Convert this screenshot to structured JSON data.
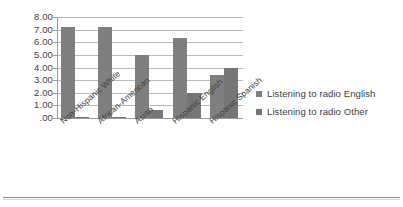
{
  "chart_data": {
    "type": "bar",
    "title": "",
    "subtitle": "",
    "xlabel": "",
    "ylabel": "",
    "categories": [
      "Non-Hispanic White",
      "African-American",
      "Asian",
      "Hispanic English",
      "Hispanic Spanish"
    ],
    "series": [
      {
        "name": "Listening to radio English",
        "color": "#7f7f7f",
        "values": [
          7.2,
          7.2,
          5.0,
          6.3,
          3.4
        ]
      },
      {
        "name": "Listening to radio Other",
        "color": "#767676",
        "values": [
          0.05,
          0.1,
          0.6,
          1.95,
          3.95
        ]
      }
    ],
    "ylim": [
      0,
      8
    ],
    "ytick_values": [
      0,
      1,
      2,
      3,
      4,
      5,
      6,
      7,
      8
    ],
    "ytick_labels": [
      ".00",
      "1.00",
      "2.00",
      "3.00",
      "4.00",
      "5.00",
      "6.00",
      "7.00",
      "8.00"
    ],
    "grid": true,
    "grid_axis": "y",
    "legend_position": "right",
    "xtick_rotation": -41
  },
  "legend": {
    "items": [
      {
        "label": "Listening to radio English",
        "marker": "square-marker",
        "color": "#7f7f7f"
      },
      {
        "label": "Listening to radio Other",
        "marker": "square-marker",
        "color": "#767676"
      }
    ]
  }
}
